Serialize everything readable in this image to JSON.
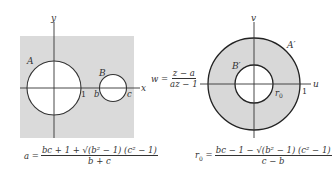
{
  "left_panel": {
    "axis_x_label": "x",
    "axis_y_label": "y",
    "circle_a_label": "A",
    "circle_b_label": "B",
    "point_1_label": "1",
    "point_b_label": "b",
    "point_c_label": "c",
    "formula": {
      "lhs": "a =",
      "numerator": "bc + 1 + √(b² − 1) (c² − 1)",
      "denominator": "b + c"
    }
  },
  "mapping": {
    "lhs": "w =",
    "numerator": "z − a",
    "denominator": "az − 1"
  },
  "right_panel": {
    "axis_u_label": "u",
    "axis_v_label": "v",
    "outer_circle_label": "A′",
    "inner_circle_label": "B′",
    "point_1_label": "1",
    "radius_label": "r",
    "radius_sub": "0",
    "formula": {
      "lhs_main": "r",
      "lhs_sub": "0",
      "eq": "=",
      "numerator": "bc − 1 − √(b² − 1) (c² − 1)",
      "denominator": "c − b"
    }
  },
  "colors": {
    "region_fill": "#d8d8d8",
    "line": "#333333",
    "background": "#ffffff"
  }
}
